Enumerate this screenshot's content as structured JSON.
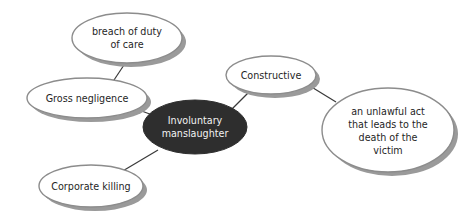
{
  "diagram": {
    "type": "mind-map",
    "title": "Involuntary manslaughter",
    "background_color": "#ffffff",
    "width": 463,
    "height": 216,
    "palette": {
      "center_fill": "#2e2e2e",
      "center_text": "#f2f2f2",
      "node_fill": "#ffffff",
      "node_stroke": "#8c8c8c",
      "node_text": "#1f1f1f",
      "shadow": "#9a9a9a",
      "connector": "#3a3a3a"
    },
    "center_node": {
      "id": "involuntary-manslaughter",
      "lines": [
        "Involuntary",
        "manslaughter"
      ],
      "text": "Involuntary manslaughter"
    },
    "nodes": [
      {
        "id": "breach-of-duty-of-care",
        "lines": [
          "breach of duty",
          "of care"
        ],
        "text": "breach of duty of care"
      },
      {
        "id": "gross-negligence",
        "lines": [
          "Gross negligence"
        ],
        "text": "Gross negligence"
      },
      {
        "id": "corporate-killing",
        "lines": [
          "Corporate killing"
        ],
        "text": "Corporate killing"
      },
      {
        "id": "constructive",
        "lines": [
          "Constructive"
        ],
        "text": "Constructive"
      },
      {
        "id": "unlawful-act",
        "lines": [
          "an unlawful act",
          "that leads to the",
          "death of the",
          "victim"
        ],
        "text": "an unlawful act that leads to the death of the victim"
      }
    ],
    "edges": [
      {
        "id": "edge-breach-to-gross",
        "from": "breach-of-duty-of-care",
        "to": "gross-negligence"
      },
      {
        "id": "edge-gross-to-center",
        "from": "gross-negligence",
        "to": "involuntary-manslaughter"
      },
      {
        "id": "edge-center-to-corporate",
        "from": "involuntary-manslaughter",
        "to": "corporate-killing"
      },
      {
        "id": "edge-center-to-constructive",
        "from": "involuntary-manslaughter",
        "to": "constructive"
      },
      {
        "id": "edge-constructive-to-unlawful",
        "from": "constructive",
        "to": "unlawful-act"
      }
    ]
  }
}
